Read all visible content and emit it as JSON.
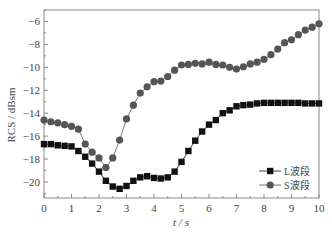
{
  "chart_data": {
    "type": "line",
    "title": "",
    "xlabel": "t / s",
    "ylabel": "RCS / dBsm",
    "xlim": [
      0,
      10
    ],
    "ylim": [
      -21.4,
      -5
    ],
    "xticks": [
      0,
      1,
      2,
      3,
      4,
      5,
      6,
      7,
      8,
      9,
      10
    ],
    "yticks": [
      -6,
      -8,
      -10,
      -12,
      -14,
      -16,
      -18,
      -20
    ],
    "ytick_labels": [
      "−6",
      "−8",
      "−10",
      "−12",
      "−14",
      "−16",
      "−18",
      "−20"
    ],
    "grid": false,
    "legend_position": "lower right",
    "x": [
      0,
      0.25,
      0.5,
      0.75,
      1.0,
      1.25,
      1.5,
      1.75,
      2.0,
      2.25,
      2.5,
      2.75,
      3.0,
      3.25,
      3.5,
      3.75,
      4.0,
      4.25,
      4.5,
      4.75,
      5.0,
      5.25,
      5.5,
      5.75,
      6.0,
      6.25,
      6.5,
      6.75,
      7.0,
      7.25,
      7.5,
      7.75,
      8.0,
      8.25,
      8.5,
      8.75,
      9.0,
      9.25,
      9.5,
      9.75,
      10.0
    ],
    "series": [
      {
        "name": "L波段",
        "marker": "square",
        "color": "#111111",
        "values": [
          -16.7,
          -16.7,
          -16.8,
          -16.85,
          -16.9,
          -17.3,
          -17.8,
          -18.4,
          -19.1,
          -19.9,
          -20.4,
          -20.6,
          -20.35,
          -19.9,
          -19.6,
          -19.5,
          -19.65,
          -19.7,
          -19.6,
          -19.1,
          -18.25,
          -17.3,
          -16.4,
          -15.6,
          -15.0,
          -14.6,
          -14.0,
          -13.75,
          -13.4,
          -13.3,
          -13.25,
          -13.15,
          -13.1,
          -13.1,
          -13.1,
          -13.1,
          -13.1,
          -13.1,
          -13.15,
          -13.15,
          -13.15
        ]
      },
      {
        "name": "S波段",
        "marker": "circle",
        "color": "#555555",
        "values": [
          -14.6,
          -14.75,
          -14.85,
          -15.0,
          -15.15,
          -15.4,
          -16.7,
          -17.4,
          -17.9,
          -18.75,
          -17.9,
          -16.35,
          -14.5,
          -13.3,
          -12.25,
          -11.7,
          -11.25,
          -11.2,
          -10.8,
          -10.25,
          -9.8,
          -9.75,
          -9.65,
          -9.7,
          -9.55,
          -9.75,
          -9.8,
          -10.0,
          -10.15,
          -9.95,
          -9.7,
          -9.55,
          -9.3,
          -8.9,
          -8.4,
          -7.85,
          -7.6,
          -7.15,
          -6.75,
          -6.5,
          -6.2
        ]
      }
    ]
  }
}
